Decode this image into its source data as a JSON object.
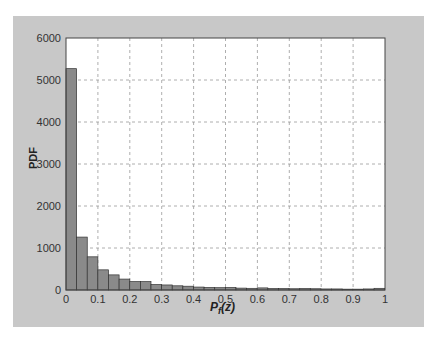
{
  "chart_data": {
    "type": "bar",
    "title": "",
    "xlabel": "P_f(z)",
    "ylabel": "PDF",
    "xlim": [
      0,
      1
    ],
    "ylim": [
      0,
      6000
    ],
    "grid": true,
    "xticks": [
      "0",
      "0.1",
      "0.2",
      "0.3",
      "0.4",
      "0.5",
      "0.6",
      "0.7",
      "0.8",
      "0.9",
      "1"
    ],
    "yticks": [
      "0",
      "1000",
      "2000",
      "3000",
      "4000",
      "5000",
      "6000"
    ],
    "bin_width": 0.0333,
    "bin_edges_start": 0,
    "values": [
      5270,
      1260,
      790,
      480,
      360,
      260,
      200,
      200,
      130,
      120,
      100,
      90,
      70,
      60,
      55,
      60,
      45,
      40,
      50,
      35,
      35,
      30,
      35,
      30,
      25,
      25,
      20,
      20,
      25,
      40
    ],
    "bar_color": "#8a8a8a",
    "bar_edge_color": "#333333",
    "background_color": "#c8c8c8"
  },
  "labels": {
    "ylabel": "PDF",
    "xlabel_main": "P",
    "xlabel_sub": "f",
    "xlabel_arg": "(z)"
  }
}
